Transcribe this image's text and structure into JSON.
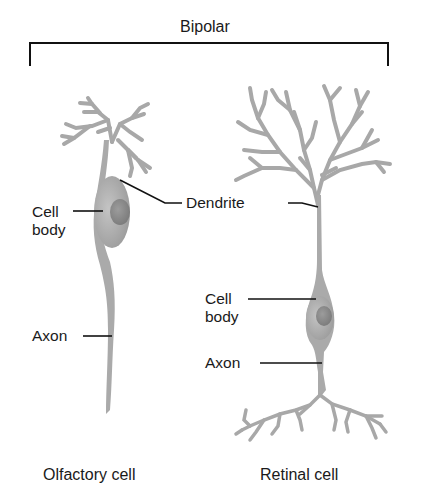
{
  "title": "Bipolar",
  "olfactory": {
    "caption": "Olfactory cell",
    "labels": {
      "cell_body_line1": "Cell",
      "cell_body_line2": "body",
      "axon": "Axon"
    }
  },
  "shared": {
    "dendrite": "Dendrite"
  },
  "retinal": {
    "caption": "Retinal cell",
    "labels": {
      "cell_body_line1": "Cell",
      "cell_body_line2": "body",
      "axon": "Axon"
    }
  },
  "colors": {
    "neuron_fill": "#a9a9a9",
    "neuron_body": "#b3b3b3",
    "nucleus": "#8e8e8e",
    "leader_line": "#111111"
  }
}
